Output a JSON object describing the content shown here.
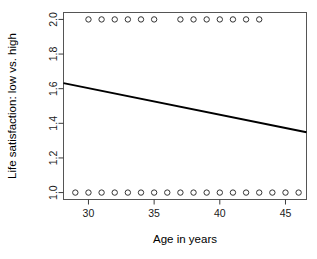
{
  "chart_data": {
    "type": "scatter",
    "title": "",
    "xlabel": "Age in years",
    "ylabel": "Life satisfaction: low vs. high",
    "xlim": [
      28.1,
      46.6
    ],
    "ylim": [
      0.96,
      2.04
    ],
    "grid": false,
    "legend": null,
    "xticks": [
      30,
      35,
      40,
      45
    ],
    "xtick_labels": [
      "30",
      "35",
      "40",
      "45"
    ],
    "yticks": [
      1.0,
      1.2,
      1.4,
      1.6,
      1.8,
      2.0
    ],
    "ytick_labels": [
      "1.0",
      "1.2",
      "1.4",
      "1.6",
      "1.8",
      "2.0"
    ],
    "points": [
      {
        "x": 29.0,
        "y": 1.0
      },
      {
        "x": 30.0,
        "y": 1.0
      },
      {
        "x": 31.0,
        "y": 1.0
      },
      {
        "x": 32.0,
        "y": 1.0
      },
      {
        "x": 33.0,
        "y": 1.0
      },
      {
        "x": 34.0,
        "y": 1.0
      },
      {
        "x": 35.0,
        "y": 1.0
      },
      {
        "x": 36.0,
        "y": 1.0
      },
      {
        "x": 37.0,
        "y": 1.0
      },
      {
        "x": 39.0,
        "y": 1.0
      },
      {
        "x": 40.0,
        "y": 1.0
      },
      {
        "x": 41.0,
        "y": 1.0
      },
      {
        "x": 42.0,
        "y": 1.0
      },
      {
        "x": 43.0,
        "y": 1.0
      },
      {
        "x": 44.0,
        "y": 1.0
      },
      {
        "x": 45.0,
        "y": 1.0
      },
      {
        "x": 46.0,
        "y": 1.0
      },
      {
        "x": 38.0,
        "y": 1.0
      },
      {
        "x": 30.0,
        "y": 2.0
      },
      {
        "x": 31.0,
        "y": 2.0
      },
      {
        "x": 32.0,
        "y": 2.0
      },
      {
        "x": 33.0,
        "y": 2.0
      },
      {
        "x": 34.0,
        "y": 2.0
      },
      {
        "x": 35.0,
        "y": 2.0
      },
      {
        "x": 37.0,
        "y": 2.0
      },
      {
        "x": 38.0,
        "y": 2.0
      },
      {
        "x": 39.0,
        "y": 2.0
      },
      {
        "x": 40.0,
        "y": 2.0
      },
      {
        "x": 41.0,
        "y": 2.0
      },
      {
        "x": 42.0,
        "y": 2.0
      },
      {
        "x": 43.0,
        "y": 2.0
      }
    ],
    "marker": "open-circle",
    "fit_line": {
      "type": "linear-regression",
      "x_start": 28.1,
      "y_start": 1.632,
      "x_end": 46.6,
      "y_end": 1.348
    }
  }
}
